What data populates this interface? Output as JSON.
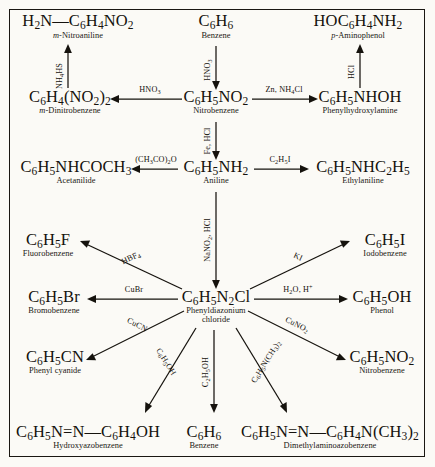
{
  "diagram": {
    "type": "reaction-scheme",
    "border_color": "#1a1712",
    "background_color": "#fbfaf6",
    "ink_color": "#15120d"
  },
  "species": {
    "m_nitroaniline": {
      "formula": "H2N—C6H4NO2",
      "name": "m-Nitroaniline",
      "name_italic_prefix": "m"
    },
    "benzene_top": {
      "formula": "C6H6",
      "name": "Benzene"
    },
    "p_aminophenol": {
      "formula": "HOC6H4NH2",
      "name": "p-Aminophenol",
      "name_italic_prefix": "p"
    },
    "m_dinitrobenzene": {
      "formula": "C6H4(NO2)2",
      "name": "m-Dinitrobenzene",
      "name_italic_prefix": "m"
    },
    "nitrobenzene": {
      "formula": "C6H5NO2",
      "name": "Nitrobenzene"
    },
    "phenylhydroxylamine": {
      "formula": "C6H5NHOH",
      "name": "Phenylhydroxylamine"
    },
    "acetanilide": {
      "formula": "C6H5NHCOCH3",
      "name": "Acetanilide"
    },
    "aniline": {
      "formula": "C6H5NH2",
      "name": "Aniline"
    },
    "ethylaniline": {
      "formula": "C6H5NHC2H5",
      "name": "Ethylaniline"
    },
    "fluorobenzene": {
      "formula": "C6H5F",
      "name": "Fluorobenzene"
    },
    "iodobenzene": {
      "formula": "C6H5I",
      "name": "Iodobenzene"
    },
    "bromobenzene": {
      "formula": "C6H5Br",
      "name": "Bromobenzene"
    },
    "diazonium": {
      "formula": "C6H5N2Cl",
      "name": "Phenyldiazonium",
      "name2": "chloride"
    },
    "phenol": {
      "formula": "C6H5OH",
      "name": "Phenol"
    },
    "phenyl_cyanide": {
      "formula": "C6H5CN",
      "name": "Phenyl cyanide"
    },
    "nitrobenzene_b": {
      "formula": "C6H5NO2",
      "name": "Nitrobenzene"
    },
    "hydroxyazobenzene": {
      "formula": "C6H5N=N—C6H4OH",
      "name": "Hydroxyazobenzene"
    },
    "benzene_bottom": {
      "formula": "C6H6",
      "name": "Benzene"
    },
    "dimethylaminoazobenzene": {
      "formula": "C6H5N=N—C6H4N(CH3)2",
      "name": "Dimethylaminoazobenzene"
    }
  },
  "reagents": {
    "nh4hs": "NH4HS",
    "hno3_vert": "HNO3",
    "hcl": "HCl",
    "hno3_horiz": "HNO3",
    "zn_nh4cl": "Zn, NH4Cl",
    "fe_hcl": "Fe, HCl",
    "ch3co2o": "(CH3CO)2O",
    "c2h5i": "C2H5I",
    "nano2_hcl": "NaNO2, HCl",
    "hbf4": "HBF4",
    "ki": "KI",
    "cubr": "CuBr",
    "h2o_hplus": "H2O, H+",
    "cucn": "CuCN",
    "cuno2": "CuNO2",
    "c6h5oh": "C6H5OH",
    "c2h5oh": "C2H5OH",
    "c6h5nch3_2": "C6H5N(CH3)2"
  }
}
